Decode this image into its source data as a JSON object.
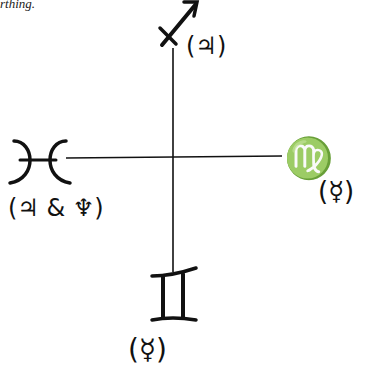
{
  "caption_fragment": "rthing.",
  "diagram": {
    "type": "astrological cross of mutable signs",
    "center": {
      "x": 173,
      "y": 158
    },
    "top": {
      "sign": "♐",
      "sign_name": "Sagittarius",
      "ruler_label": "(♃)",
      "ruler_name": "Jupiter"
    },
    "right": {
      "sign": "♍",
      "sign_name": "Virgo",
      "ruler_label": "(☿)",
      "ruler_name": "Mercury"
    },
    "bottom": {
      "sign": "♊",
      "sign_name": "Gemini",
      "ruler_label": "(☿)",
      "ruler_name": "Mercury"
    },
    "left": {
      "sign": "♓",
      "sign_name": "Pisces",
      "ruler_label": "(♃ & ♆)",
      "ruler_name": "Jupiter & Neptune"
    },
    "line_color": "#111111"
  }
}
